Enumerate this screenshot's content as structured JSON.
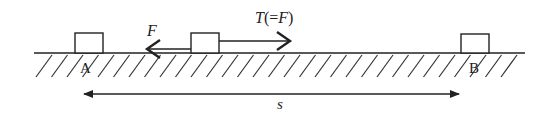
{
  "diagram": {
    "labels": {
      "point_a": "A",
      "point_b": "B",
      "friction_force": "F",
      "tension_force": "T(=F)",
      "displacement": "s"
    },
    "colors": {
      "line": "#222222",
      "background": "#ffffff"
    },
    "elements": {
      "ground": {
        "x1": 34,
        "x2": 525,
        "y": 53
      },
      "block_a": {
        "x": 75,
        "y": 33,
        "w": 28,
        "h": 20
      },
      "block_mid": {
        "x": 191,
        "y": 33,
        "w": 28,
        "h": 20
      },
      "block_b": {
        "x": 461,
        "y": 34,
        "w": 28,
        "h": 19
      },
      "friction_arrow": {
        "from_x": 191,
        "to_x": 146,
        "y": 49,
        "direction": "left"
      },
      "tension_arrow": {
        "from_x": 219,
        "to_x": 291,
        "y": 41,
        "direction": "right"
      },
      "displacement_arrow": {
        "from_x": 83,
        "to_x": 460,
        "y": 94,
        "direction": "both"
      }
    }
  }
}
